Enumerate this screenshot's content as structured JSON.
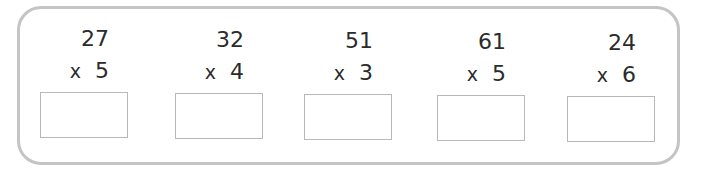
{
  "worksheet": {
    "problems": [
      {
        "multiplicand": "27",
        "operator": "x",
        "multiplier": "5",
        "answer": ""
      },
      {
        "multiplicand": "32",
        "operator": "x",
        "multiplier": "4",
        "answer": ""
      },
      {
        "multiplicand": "51",
        "operator": "x",
        "multiplier": "3",
        "answer": ""
      },
      {
        "multiplicand": "61",
        "operator": "x",
        "multiplier": "5",
        "answer": ""
      },
      {
        "multiplicand": "24",
        "operator": "x",
        "multiplier": "6",
        "answer": ""
      }
    ]
  },
  "colors": {
    "frame_border": "#c4c4c4",
    "box_border": "#b8b8b8",
    "text": "#2b2b2b"
  }
}
